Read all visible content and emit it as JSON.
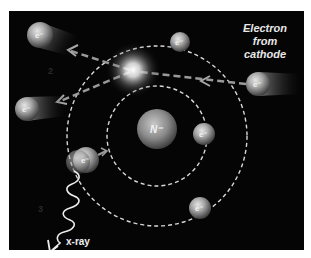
{
  "diagram": {
    "caption_lines": [
      "Electron",
      "from",
      "cathode"
    ],
    "xray_label": "x-ray",
    "nucleus_label": "N⁻",
    "electron_label": "e⁻",
    "shell_labels": [
      "2",
      "3"
    ],
    "colors": {
      "background": "#050505",
      "page": "#ffffff",
      "orbit": "#d8d8d8",
      "path": "#9a9a9a",
      "sphere_light": "#d0d0d0",
      "sphere_dark": "#4a4a4a",
      "text": "#ffffff"
    },
    "elements": {
      "nucleus": {
        "x": 157,
        "y": 129,
        "r": 20
      },
      "inner_orbit": {
        "cx": 157,
        "cy": 136,
        "r": 50
      },
      "outer_orbit": {
        "cx": 157,
        "cy": 136,
        "r": 90
      },
      "electrons": [
        {
          "id": "outer-top",
          "x": 180,
          "y": 42,
          "r": 10
        },
        {
          "id": "inner-right",
          "x": 204,
          "y": 134,
          "r": 11
        },
        {
          "id": "outer-bottom-right",
          "x": 200,
          "y": 208,
          "r": 11
        },
        {
          "id": "emitter",
          "x": 86,
          "y": 160,
          "r": 13
        },
        {
          "id": "incoming",
          "x": 258,
          "y": 84,
          "r": 12
        },
        {
          "id": "ejected-top",
          "x": 40,
          "y": 35,
          "r": 13
        },
        {
          "id": "ejected-left",
          "x": 27,
          "y": 109,
          "r": 12
        }
      ],
      "collision_flash": {
        "x": 133,
        "y": 70
      }
    }
  }
}
